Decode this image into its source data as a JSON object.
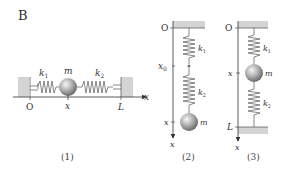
{
  "panel_label": "B",
  "colors": {
    "wall": "#d4d4d4",
    "spring": "#555555",
    "axis": "#333333",
    "ball_light": "#f4f4f4",
    "ball_dark": "#6a6a6a"
  },
  "figures": [
    {
      "id": "1",
      "caption": "(1)",
      "orientation": "horizontal",
      "labels": {
        "origin": "O",
        "spring1": "k",
        "spring1_sub": "1",
        "mass": "m",
        "spring2": "k",
        "spring2_sub": "2",
        "position": "x",
        "end": "L",
        "axis": "x"
      }
    },
    {
      "id": "2",
      "caption": "(2)",
      "orientation": "vertical-hanging",
      "labels": {
        "origin": "O",
        "spring1": "k",
        "spring1_sub": "1",
        "junction": "x",
        "junction_sub": "0",
        "spring2": "k",
        "spring2_sub": "2",
        "position": "x",
        "mass": "m",
        "axis": "x"
      }
    },
    {
      "id": "3",
      "caption": "(3)",
      "orientation": "vertical-between-walls",
      "labels": {
        "origin": "O",
        "spring1": "k",
        "spring1_sub": "1",
        "position": "x",
        "mass": "m",
        "spring2": "k",
        "spring2_sub": "2",
        "end": "L",
        "axis": "x"
      }
    }
  ]
}
